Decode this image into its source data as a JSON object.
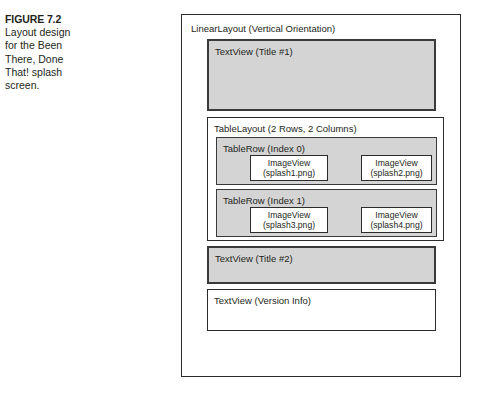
{
  "caption": {
    "figure_number": "FIGURE 7.2",
    "text": "Layout design for the Been There, Done That! splash screen."
  },
  "diagram": {
    "root": {
      "label": "LinearLayout (Vertical Orientation)"
    },
    "title1": {
      "label": "TextView (Title #1)"
    },
    "table_layout": {
      "label": "TableLayout (2 Rows, 2 Columns)",
      "rows": [
        {
          "label": "TableRow (Index 0)",
          "cells": [
            {
              "type": "ImageView",
              "source": "(splash1.png)"
            },
            {
              "type": "ImageView",
              "source": "(splash2.png)"
            }
          ]
        },
        {
          "label": "TableRow (Index 1)",
          "cells": [
            {
              "type": "ImageView",
              "source": "(splash3.png)"
            },
            {
              "type": "ImageView",
              "source": "(splash4.png)"
            }
          ]
        }
      ]
    },
    "title2": {
      "label": "TextView (Title #2)"
    },
    "version": {
      "label": "TextView (Version Info)"
    }
  },
  "colors": {
    "fill_gray": "#d4d4d4",
    "border_dark": "#2b2b2b",
    "text": "#231f20",
    "background": "#ffffff"
  }
}
